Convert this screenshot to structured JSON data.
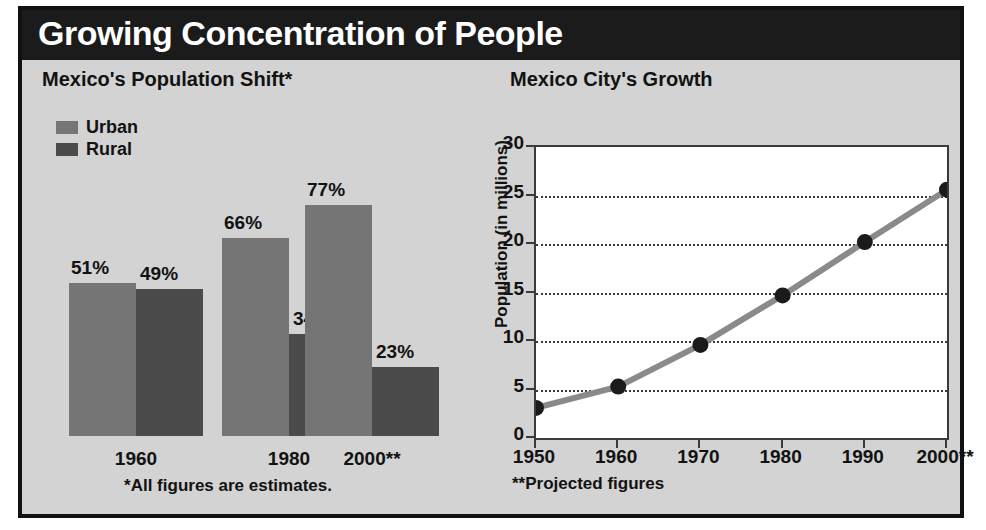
{
  "header": {
    "title": "Growing Concentration of People"
  },
  "panels": {
    "bar": {
      "title": "Mexico's Population Shift*",
      "footnote": "*All figures are estimates."
    },
    "line": {
      "title": "Mexico City's Growth",
      "footnote": "**Projected figures"
    }
  },
  "colors": {
    "background": "#d3d3d3",
    "header_bar": "#1b1b1b",
    "urban_bar": "#757575",
    "rural_bar": "#4b4b4b",
    "plot_background": "#ffffff",
    "line": "#8a8a8a",
    "marker": "#1b1b1b",
    "axis": "#3a3a3a",
    "text": "#121212"
  },
  "chart_data": [
    {
      "type": "bar",
      "title": "Mexico's Population Shift*",
      "xlabel": "",
      "ylabel": "",
      "ylim": [
        0,
        100
      ],
      "grid": false,
      "legend_position": "top-left",
      "categories": [
        "1960",
        "1980",
        "2000**"
      ],
      "series": [
        {
          "name": "Urban",
          "values": [
            51,
            66,
            77
          ],
          "labels": [
            "51%",
            "66%",
            "77%"
          ]
        },
        {
          "name": "Rural",
          "values": [
            49,
            34,
            23
          ],
          "labels": [
            "49%",
            "34%",
            "23%"
          ]
        }
      ],
      "footnote": "*All figures are estimates."
    },
    {
      "type": "line",
      "title": "Mexico City's Growth",
      "xlabel": "",
      "ylabel": "Population (in millions)",
      "xlim": [
        1950,
        2000
      ],
      "ylim": [
        0,
        30
      ],
      "grid": true,
      "legend_position": "none",
      "x": [
        "1950",
        "1960",
        "1970",
        "1980",
        "1990",
        "2000**"
      ],
      "values": [
        3.1,
        5.3,
        9.6,
        14.7,
        20.2,
        25.6
      ],
      "yticks": [
        "0",
        "5",
        "10",
        "15",
        "20",
        "25",
        "30"
      ],
      "footnote": "**Projected figures"
    }
  ]
}
